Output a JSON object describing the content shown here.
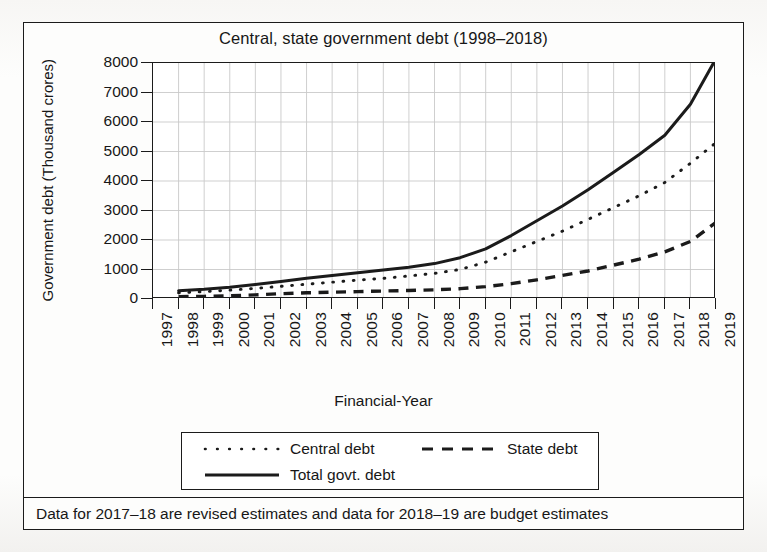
{
  "figure": {
    "title": "Central, state government debt (1998–2018)",
    "x_axis_title": "Financial-Year",
    "y_axis_title": "Government debt (Thousand crores)",
    "footnote": "Data for 2017–18 are revised estimates and data for 2018–19 are budget estimates"
  },
  "legend": {
    "entries": [
      {
        "label": "Central debt",
        "style": "dotted"
      },
      {
        "label": "State debt",
        "style": "dashed"
      },
      {
        "label": "Total govt. debt",
        "style": "solid"
      }
    ]
  },
  "colors": {
    "ink": "#1b1b1b",
    "grid": "#c9c9c9",
    "paper": "#fdfdfc",
    "plot_bg": "#ffffff"
  },
  "chart_data": {
    "type": "line",
    "title": "Central, state government debt (1998–2018)",
    "xlabel": "Financial-Year",
    "ylabel": "Government debt (Thousand crores)",
    "xlim": [
      1997,
      2019
    ],
    "ylim": [
      0,
      8000
    ],
    "ytick_labels": [
      "0",
      "1000",
      "2000",
      "3000",
      "4000",
      "5000",
      "6000",
      "7000",
      "8000"
    ],
    "yticks": [
      0,
      1000,
      2000,
      3000,
      4000,
      5000,
      6000,
      7000,
      8000
    ],
    "xticks": [
      1997,
      1998,
      1999,
      2000,
      2001,
      2002,
      2003,
      2004,
      2005,
      2006,
      2007,
      2008,
      2009,
      2010,
      2011,
      2012,
      2013,
      2014,
      2015,
      2016,
      2017,
      2018,
      2019
    ],
    "xtick_labels": [
      "1997",
      "1998",
      "1999",
      "2000",
      "2001",
      "2002",
      "2003",
      "2004",
      "2005",
      "2006",
      "2007",
      "2008",
      "2009",
      "2010",
      "2011",
      "2012",
      "2013",
      "2014",
      "2015",
      "2016",
      "2017",
      "2018",
      "2019"
    ],
    "grid": true,
    "legend_position": "below-axes",
    "x": [
      1998,
      1999,
      2000,
      2001,
      2002,
      2003,
      2004,
      2005,
      2006,
      2007,
      2008,
      2009,
      2010,
      2011,
      2012,
      2013,
      2014,
      2015,
      2016,
      2017,
      2018,
      2019
    ],
    "series": [
      {
        "name": "Central debt",
        "style": "dotted",
        "values": [
          210,
          250,
          300,
          360,
          430,
          500,
          570,
          640,
          700,
          780,
          870,
          1000,
          1250,
          1600,
          1950,
          2300,
          2700,
          3100,
          3500,
          3950,
          4600,
          5300
        ]
      },
      {
        "name": "State debt",
        "style": "dashed",
        "values": [
          80,
          90,
          110,
          140,
          180,
          210,
          230,
          250,
          270,
          290,
          310,
          350,
          420,
          520,
          650,
          800,
          950,
          1150,
          1350,
          1600,
          1950,
          2600
        ]
      },
      {
        "name": "Total govt. debt",
        "style": "solid",
        "values": [
          280,
          330,
          400,
          490,
          590,
          700,
          800,
          890,
          980,
          1080,
          1200,
          1400,
          1700,
          2150,
          2650,
          3150,
          3700,
          4300,
          4900,
          5550,
          6600,
          8150
        ]
      }
    ]
  }
}
